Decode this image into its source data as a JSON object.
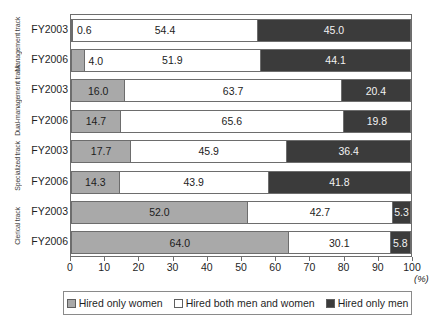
{
  "chart_data": {
    "type": "bar",
    "subtype": "stacked-horizontal-100",
    "title": "",
    "xlabel": "(%)",
    "ylabel": "",
    "xlim": [
      0,
      100
    ],
    "xticks": [
      0,
      10,
      20,
      30,
      40,
      50,
      60,
      70,
      80,
      90,
      100
    ],
    "grid": false,
    "legend_position": "bottom",
    "categories": [
      "FY2003",
      "FY2006",
      "FY2003",
      "FY2006",
      "FY2003",
      "FY2006",
      "FY2003",
      "FY2006"
    ],
    "groups": [
      {
        "label": "Management track",
        "rows": [
          0,
          1
        ]
      },
      {
        "label": "Dual-management track",
        "rows": [
          2,
          3
        ]
      },
      {
        "label": "Specialized track",
        "rows": [
          4,
          5
        ]
      },
      {
        "label": "Clerical track",
        "rows": [
          6,
          7
        ]
      }
    ],
    "series": [
      {
        "name": "Hired only women",
        "color": "#a9a9a9",
        "values": [
          0.6,
          4.0,
          16.0,
          14.7,
          17.7,
          14.3,
          52.0,
          64.0
        ]
      },
      {
        "name": "Hired both men and women",
        "color": "#ffffff",
        "values": [
          54.4,
          51.9,
          63.7,
          65.6,
          45.9,
          43.9,
          42.7,
          30.1
        ]
      },
      {
        "name": "Hired only men",
        "color": "#3b3b3b",
        "values": [
          45.0,
          44.1,
          20.4,
          19.8,
          36.4,
          41.8,
          5.3,
          5.8
        ]
      }
    ],
    "rows": [
      {
        "group": "Management track",
        "category": "FY2003",
        "segments": [
          {
            "series": "Hired only women",
            "value": 0.6,
            "label": "0.6",
            "label_outside": true
          },
          {
            "series": "Hired both men and women",
            "value": 54.4,
            "label": "54.4"
          },
          {
            "series": "Hired only men",
            "value": 45.0,
            "label": "45.0"
          }
        ]
      },
      {
        "group": "Management track",
        "category": "FY2006",
        "segments": [
          {
            "series": "Hired only women",
            "value": 4.0,
            "label": "4.0",
            "label_outside": true
          },
          {
            "series": "Hired both men and women",
            "value": 51.9,
            "label": "51.9"
          },
          {
            "series": "Hired only men",
            "value": 44.1,
            "label": "44.1"
          }
        ]
      },
      {
        "group": "Dual-management track",
        "category": "FY2003",
        "segments": [
          {
            "series": "Hired only women",
            "value": 16.0,
            "label": "16.0"
          },
          {
            "series": "Hired both men and women",
            "value": 63.7,
            "label": "63.7"
          },
          {
            "series": "Hired only men",
            "value": 20.4,
            "label": "20.4"
          }
        ]
      },
      {
        "group": "Dual-management track",
        "category": "FY2006",
        "segments": [
          {
            "series": "Hired only women",
            "value": 14.7,
            "label": "14.7"
          },
          {
            "series": "Hired both men and women",
            "value": 65.6,
            "label": "65.6"
          },
          {
            "series": "Hired only men",
            "value": 19.8,
            "label": "19.8"
          }
        ]
      },
      {
        "group": "Specialized track",
        "category": "FY2003",
        "segments": [
          {
            "series": "Hired only women",
            "value": 17.7,
            "label": "17.7"
          },
          {
            "series": "Hired both men and women",
            "value": 45.9,
            "label": "45.9"
          },
          {
            "series": "Hired only men",
            "value": 36.4,
            "label": "36.4"
          }
        ]
      },
      {
        "group": "Specialized track",
        "category": "FY2006",
        "segments": [
          {
            "series": "Hired only women",
            "value": 14.3,
            "label": "14.3"
          },
          {
            "series": "Hired both men and women",
            "value": 43.9,
            "label": "43.9"
          },
          {
            "series": "Hired only men",
            "value": 41.8,
            "label": "41.8"
          }
        ]
      },
      {
        "group": "Clerical track",
        "category": "FY2003",
        "segments": [
          {
            "series": "Hired only women",
            "value": 52.0,
            "label": "52.0"
          },
          {
            "series": "Hired both men and women",
            "value": 42.7,
            "label": "42.7"
          },
          {
            "series": "Hired only men",
            "value": 5.3,
            "label": "5.3"
          }
        ]
      },
      {
        "group": "Clerical track",
        "category": "FY2006",
        "segments": [
          {
            "series": "Hired only women",
            "value": 64.0,
            "label": "64.0"
          },
          {
            "series": "Hired both men and women",
            "value": 30.1,
            "label": "30.1"
          },
          {
            "series": "Hired only men",
            "value": 5.8,
            "label": "5.8"
          }
        ]
      }
    ],
    "legend": [
      {
        "label": "Hired only women",
        "color": "#a9a9a9"
      },
      {
        "label": "Hired both men and women",
        "color": "#ffffff"
      },
      {
        "label": "Hired only men",
        "color": "#3b3b3b"
      }
    ]
  }
}
